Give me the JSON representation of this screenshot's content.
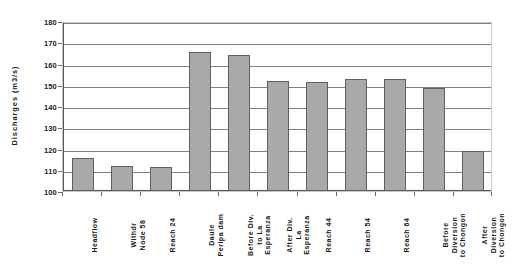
{
  "chart_data": {
    "type": "bar",
    "title": "",
    "xlabel": "",
    "ylabel": "Discharges (m3/s)",
    "ylim": [
      100,
      180
    ],
    "ytick_step": 10,
    "yticks": [
      180,
      170,
      160,
      150,
      140,
      130,
      120,
      110,
      100
    ],
    "grid": true,
    "legend": "none",
    "bar_color": "#a9a9a9",
    "bar_border_color": "#5f5f5f",
    "gridline_color": "#808080",
    "categories": [
      "Headflow",
      "Withdr\nNode 58",
      "Reach 24",
      "Daule\nPeripa dam",
      "Before Div.\nto La\nEsperanza",
      "After Div.\nLa\nEsperanza",
      "Reach 44",
      "Reach 54",
      "Reach 64",
      "Before\nDiversion\nto Chongon",
      "After\nDiversion\nto Chongon"
    ],
    "values": [
      115.5,
      112,
      111.5,
      165.5,
      164,
      152,
      151.5,
      152.5,
      152.5,
      148.5,
      119
    ],
    "series": [
      {
        "name": "Discharges",
        "values": [
          115.5,
          112,
          111.5,
          165.5,
          164,
          152,
          151.5,
          152.5,
          152.5,
          148.5,
          119
        ]
      }
    ]
  }
}
